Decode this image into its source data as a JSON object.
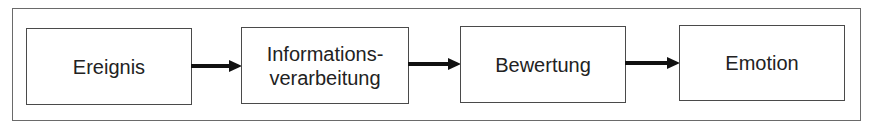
{
  "diagram": {
    "type": "flow",
    "direction": "left-to-right",
    "nodes": [
      {
        "id": "ereignis",
        "label": "Ereignis"
      },
      {
        "id": "informationsverarbeitung",
        "label_line1": "Informations-",
        "label_line2": "verarbeitung"
      },
      {
        "id": "bewertung",
        "label": "Bewertung"
      },
      {
        "id": "emotion",
        "label": "Emotion"
      }
    ],
    "edges": [
      {
        "from": "ereignis",
        "to": "informationsverarbeitung"
      },
      {
        "from": "informationsverarbeitung",
        "to": "bewertung"
      },
      {
        "from": "bewertung",
        "to": "emotion"
      }
    ],
    "colors": {
      "stroke": "#4a4a4a",
      "arrow": "#111111",
      "text": "#222222",
      "background": "#ffffff"
    }
  }
}
